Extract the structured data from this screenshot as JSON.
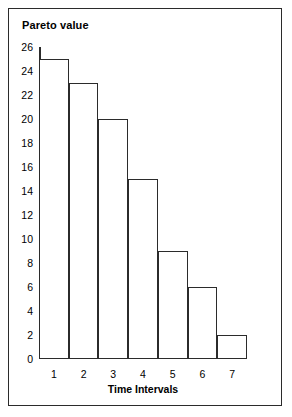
{
  "chart_data": {
    "type": "bar",
    "title": "Pareto value",
    "xlabel": "Time Intervals",
    "ylabel": "",
    "categories": [
      "1",
      "2",
      "3",
      "4",
      "5",
      "6",
      "7"
    ],
    "values": [
      25,
      23,
      20,
      15,
      9,
      6,
      2
    ],
    "ylim": [
      0,
      26
    ],
    "xlim": [
      0,
      7
    ],
    "y_ticks": [
      0,
      2,
      4,
      6,
      8,
      10,
      12,
      14,
      16,
      18,
      20,
      22,
      24,
      26
    ],
    "y_tick_labels": [
      "0",
      "2",
      "4",
      "6",
      "8",
      "10",
      "12",
      "14",
      "16",
      "18",
      "20",
      "22",
      "24",
      "26"
    ],
    "grid": false,
    "legend": null,
    "bar_gap": 0,
    "colors": {
      "bar_fill": "#ffffff",
      "bar_stroke": "#2b2b2b",
      "axis": "#2b2b2b",
      "text": "#000000",
      "background": "#ffffff",
      "frame": "#2b2b2b"
    }
  }
}
